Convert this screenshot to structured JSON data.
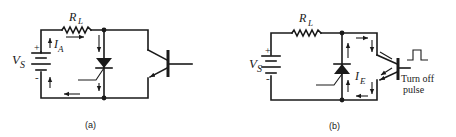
{
  "figure": {
    "panels": [
      {
        "id": "a",
        "caption": "(a)",
        "labels": {
          "source": "V",
          "source_sub": "S",
          "resistor": "R",
          "resistor_sub": "L",
          "current": "I",
          "current_sub": "A",
          "plus": "+",
          "minus": "-"
        },
        "components": [
          "battery",
          "load-resistor",
          "thyristor",
          "transistor"
        ],
        "description": "Thyristor conducting anode current I_A from source V_S through R_L"
      },
      {
        "id": "b",
        "caption": "(b)",
        "labels": {
          "source": "V",
          "source_sub": "S",
          "resistor": "R",
          "resistor_sub": "L",
          "current": "I",
          "current_sub": "E",
          "plus": "+",
          "minus": "-",
          "pulse_line1": "Turn  off",
          "pulse_line2": "pulse"
        },
        "components": [
          "battery",
          "load-resistor",
          "thyristor",
          "transistor",
          "turn-off-pulse"
        ],
        "description": "Transistor driven by turn-off pulse diverts current I_E around the thyristor"
      }
    ],
    "colors": {
      "ink": "#1a1a1a",
      "background": "#ffffff"
    }
  }
}
